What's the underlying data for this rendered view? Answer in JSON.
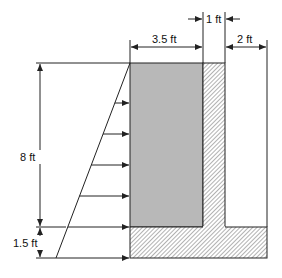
{
  "diagram": {
    "dimensions": {
      "soil_width": "3.5 ft",
      "stem_thickness": "1 ft",
      "toe_width": "2 ft",
      "wall_height": "8 ft",
      "footing_thickness": "1.5 ft"
    },
    "colors": {
      "soil": "#b8b8b8",
      "line": "#222222",
      "hatch": "#555555",
      "background": "#ffffff"
    },
    "pressure_arrow_count": 7
  }
}
